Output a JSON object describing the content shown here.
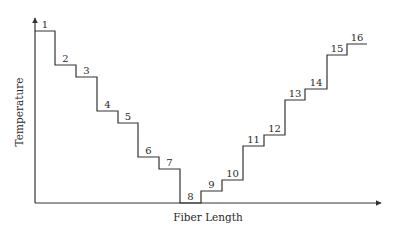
{
  "diagram": {
    "type": "step_profile",
    "x_axis_label": "Fiber Length",
    "y_axis_label": "Temperature",
    "line_color": "#333333",
    "steps": [
      {
        "label": "1",
        "x1": 35,
        "x2": 55,
        "y": 31
      },
      {
        "label": "2",
        "x1": 55,
        "x2": 76,
        "y": 65
      },
      {
        "label": "3",
        "x1": 76,
        "x2": 97,
        "y": 77
      },
      {
        "label": "4",
        "x1": 97,
        "x2": 118,
        "y": 111
      },
      {
        "label": "5",
        "x1": 118,
        "x2": 138,
        "y": 123
      },
      {
        "label": "6",
        "x1": 138,
        "x2": 159,
        "y": 157
      },
      {
        "label": "7",
        "x1": 159,
        "x2": 180,
        "y": 169
      },
      {
        "label": "8",
        "x1": 180,
        "x2": 201,
        "y": 203
      },
      {
        "label": "9",
        "x1": 201,
        "x2": 222,
        "y": 191
      },
      {
        "label": "10",
        "x1": 222,
        "x2": 243,
        "y": 180
      },
      {
        "label": "11",
        "x1": 243,
        "x2": 264,
        "y": 146
      },
      {
        "label": "12",
        "x1": 264,
        "x2": 285,
        "y": 135
      },
      {
        "label": "13",
        "x1": 285,
        "x2": 305,
        "y": 100
      },
      {
        "label": "14",
        "x1": 305,
        "x2": 327,
        "y": 89
      },
      {
        "label": "15",
        "x1": 327,
        "x2": 347,
        "y": 55
      },
      {
        "label": "16",
        "x1": 347,
        "x2": 367,
        "y": 44
      }
    ]
  }
}
